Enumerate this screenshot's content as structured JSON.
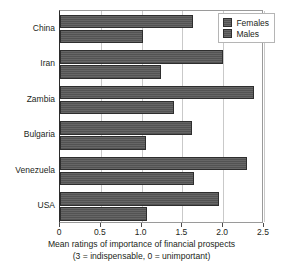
{
  "chart_data": {
    "type": "bar",
    "orientation": "horizontal",
    "title": "",
    "xlabel": "Mean ratings of importance of financial prospects",
    "xlabel_note": "(3 = indispensable, 0 = unimportant)",
    "ylabel": "",
    "categories": [
      "China",
      "Iran",
      "Zambia",
      "Bulgaria",
      "Venezuela",
      "USA"
    ],
    "series": [
      {
        "name": "Females",
        "values": [
          1.63,
          2.0,
          2.38,
          1.62,
          2.29,
          1.95
        ]
      },
      {
        "name": "Males",
        "values": [
          1.02,
          1.24,
          1.4,
          1.05,
          1.64,
          1.07
        ]
      }
    ],
    "xlim": [
      0,
      2.5
    ],
    "xticks": [
      0,
      0.5,
      1.0,
      1.5,
      2.0,
      2.5
    ],
    "xtick_labels": [
      "0",
      "0.5",
      "1.0",
      "1.5",
      "2.0",
      "2.5"
    ],
    "grid": true,
    "grid_axis": "x",
    "legend_position": "top-right",
    "bar_color": "#585858",
    "bar_edge_color": "#2e2e2e",
    "grid_color": "#c9c9c9",
    "axis_color": "#2b2b2b",
    "text_color": "#231f20"
  },
  "legend": {
    "entries": [
      {
        "label": "Females"
      },
      {
        "label": "Males"
      }
    ]
  }
}
